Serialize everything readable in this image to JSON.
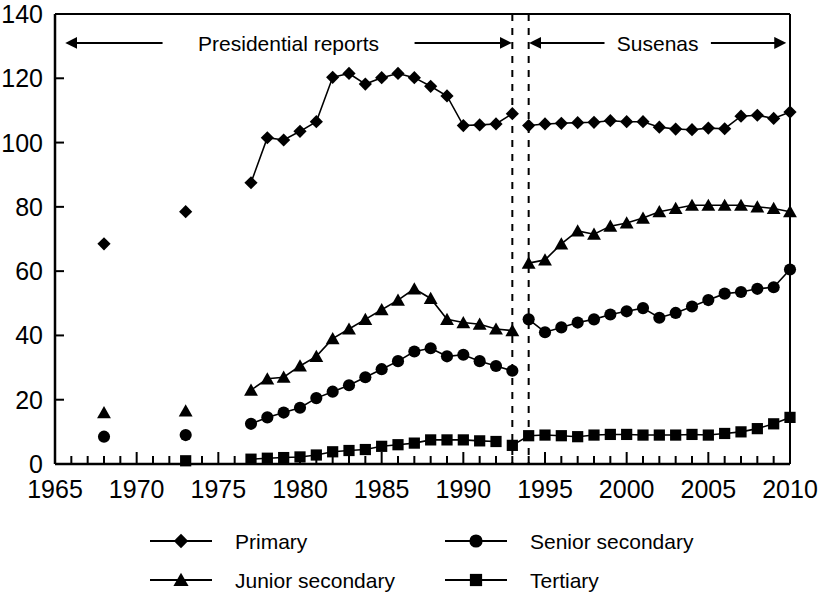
{
  "chart_data": {
    "type": "line",
    "title": "",
    "xlabel": "",
    "ylabel": "",
    "xlim": [
      1965,
      2010
    ],
    "ylim": [
      0,
      140
    ],
    "grid": false,
    "legend_position": "bottom",
    "xticks": [
      1965,
      1970,
      1975,
      1980,
      1985,
      1990,
      1995,
      2000,
      2005,
      2010
    ],
    "xtick_labels": [
      "1965",
      "1970",
      "1975",
      "1980",
      "1985",
      "1990",
      "1995",
      "2000",
      "2005",
      "2010"
    ],
    "xminor_step": 1,
    "yticks": [
      0,
      20,
      40,
      60,
      80,
      100,
      120,
      140
    ],
    "ytick_labels": [
      "0",
      "20",
      "40",
      "60",
      "80",
      "100",
      "120",
      "140"
    ],
    "annotations": [
      {
        "name": "presidential-reports-span",
        "label": "Presidential reports",
        "x_start": 1965.8,
        "x_end": 1992.8,
        "y": 131,
        "arrow": "both"
      },
      {
        "name": "susenas-span",
        "label": "Susenas",
        "x_start": 1994.2,
        "x_end": 2009.6,
        "y": 131,
        "arrow": "both"
      }
    ],
    "vlines": [
      {
        "name": "vline-1993",
        "x": 1993,
        "style": "dashed"
      },
      {
        "name": "vline-1994",
        "x": 1994,
        "style": "dashed"
      }
    ],
    "series": [
      {
        "name": "Primary",
        "marker": "diamond",
        "color": "#000000",
        "segments": [
          {
            "points": [
              [
                1968,
                68.5
              ]
            ]
          },
          {
            "points": [
              [
                1973,
                78.5
              ]
            ]
          },
          {
            "points": [
              [
                1977,
                87.5
              ],
              [
                1978,
                101.5
              ],
              [
                1979,
                100.8
              ],
              [
                1980,
                103.5
              ],
              [
                1981,
                106.5
              ],
              [
                1982,
                120.3
              ],
              [
                1983,
                121.5
              ],
              [
                1984,
                118.2
              ],
              [
                1985,
                120.2
              ],
              [
                1986,
                121.5
              ],
              [
                1987,
                120.2
              ],
              [
                1988,
                117.5
              ],
              [
                1989,
                114.5
              ],
              [
                1990,
                105.3
              ],
              [
                1991,
                105.5
              ],
              [
                1992,
                105.8
              ],
              [
                1993,
                109.0
              ]
            ]
          },
          {
            "points": [
              [
                1994,
                105.3
              ],
              [
                1995,
                105.8
              ],
              [
                1996,
                106.0
              ],
              [
                1997,
                106.2
              ],
              [
                1998,
                106.3
              ],
              [
                1999,
                106.8
              ],
              [
                2000,
                106.5
              ],
              [
                2001,
                106.5
              ],
              [
                2002,
                104.8
              ],
              [
                2003,
                104.2
              ],
              [
                2004,
                104.0
              ],
              [
                2005,
                104.5
              ],
              [
                2006,
                104.3
              ],
              [
                2007,
                108.2
              ],
              [
                2008,
                108.5
              ],
              [
                2009,
                107.5
              ],
              [
                2010,
                109.5
              ]
            ]
          }
        ]
      },
      {
        "name": "Junior secondary",
        "marker": "triangle",
        "color": "#000000",
        "segments": [
          {
            "points": [
              [
                1968,
                16.0
              ]
            ]
          },
          {
            "points": [
              [
                1973,
                16.5
              ]
            ]
          },
          {
            "points": [
              [
                1977,
                23.0
              ],
              [
                1978,
                26.5
              ],
              [
                1979,
                27.0
              ],
              [
                1980,
                30.5
              ],
              [
                1981,
                33.5
              ],
              [
                1982,
                39.0
              ],
              [
                1983,
                42.0
              ],
              [
                1984,
                45.0
              ],
              [
                1985,
                48.0
              ],
              [
                1986,
                51.0
              ],
              [
                1987,
                54.5
              ],
              [
                1988,
                51.5
              ],
              [
                1989,
                45.0
              ],
              [
                1990,
                44.0
              ],
              [
                1991,
                43.5
              ],
              [
                1992,
                42.0
              ],
              [
                1993,
                41.5
              ]
            ]
          },
          {
            "points": [
              [
                1994,
                62.5
              ],
              [
                1995,
                63.5
              ],
              [
                1996,
                68.5
              ],
              [
                1997,
                72.5
              ],
              [
                1998,
                71.5
              ],
              [
                1999,
                74.0
              ],
              [
                2000,
                75.0
              ],
              [
                2001,
                76.5
              ],
              [
                2002,
                78.5
              ],
              [
                2003,
                79.5
              ],
              [
                2004,
                80.5
              ],
              [
                2005,
                80.5
              ],
              [
                2006,
                80.5
              ],
              [
                2007,
                80.5
              ],
              [
                2008,
                80.0
              ],
              [
                2009,
                79.5
              ],
              [
                2010,
                78.5
              ]
            ]
          }
        ]
      },
      {
        "name": "Senior secondary",
        "marker": "circle",
        "color": "#000000",
        "segments": [
          {
            "points": [
              [
                1968,
                8.5
              ]
            ]
          },
          {
            "points": [
              [
                1973,
                9.0
              ]
            ]
          },
          {
            "points": [
              [
                1977,
                12.5
              ],
              [
                1978,
                14.5
              ],
              [
                1979,
                16.0
              ],
              [
                1980,
                17.5
              ],
              [
                1981,
                20.5
              ],
              [
                1982,
                22.5
              ],
              [
                1983,
                24.5
              ],
              [
                1984,
                27.0
              ],
              [
                1985,
                29.5
              ],
              [
                1986,
                32.0
              ],
              [
                1987,
                35.0
              ],
              [
                1988,
                36.0
              ],
              [
                1989,
                33.5
              ],
              [
                1990,
                34.0
              ],
              [
                1991,
                32.0
              ],
              [
                1992,
                30.5
              ],
              [
                1993,
                29.0
              ]
            ]
          },
          {
            "points": [
              [
                1994,
                45.0
              ],
              [
                1995,
                41.0
              ],
              [
                1996,
                42.5
              ],
              [
                1997,
                44.0
              ],
              [
                1998,
                45.0
              ],
              [
                1999,
                46.5
              ],
              [
                2000,
                47.5
              ],
              [
                2001,
                48.5
              ],
              [
                2002,
                45.5
              ],
              [
                2003,
                47.0
              ],
              [
                2004,
                49.0
              ],
              [
                2005,
                51.0
              ],
              [
                2006,
                53.0
              ],
              [
                2007,
                53.5
              ],
              [
                2008,
                54.5
              ],
              [
                2009,
                55.0
              ],
              [
                2010,
                60.5
              ]
            ]
          }
        ]
      },
      {
        "name": "Tertiary",
        "marker": "square",
        "color": "#000000",
        "segments": [
          {
            "points": [
              [
                1973,
                1.0
              ]
            ]
          },
          {
            "points": [
              [
                1977,
                1.5
              ],
              [
                1978,
                1.8
              ],
              [
                1979,
                2.0
              ],
              [
                1980,
                2.2
              ],
              [
                1981,
                2.8
              ],
              [
                1982,
                3.8
              ],
              [
                1983,
                4.2
              ],
              [
                1984,
                4.5
              ],
              [
                1985,
                5.5
              ],
              [
                1986,
                6.0
              ],
              [
                1987,
                6.5
              ],
              [
                1988,
                7.5
              ],
              [
                1989,
                7.5
              ],
              [
                1990,
                7.5
              ],
              [
                1991,
                7.2
              ],
              [
                1992,
                7.0
              ]
            ]
          },
          {
            "points": [
              [
                1993,
                5.8
              ],
              [
                1994,
                8.8
              ],
              [
                1995,
                9.0
              ],
              [
                1996,
                8.8
              ],
              [
                1997,
                8.5
              ],
              [
                1998,
                9.0
              ],
              [
                1999,
                9.2
              ],
              [
                2000,
                9.2
              ],
              [
                2001,
                9.0
              ],
              [
                2002,
                9.0
              ],
              [
                2003,
                9.0
              ],
              [
                2004,
                9.2
              ],
              [
                2005,
                9.0
              ],
              [
                2006,
                9.5
              ],
              [
                2007,
                10.0
              ],
              [
                2008,
                11.0
              ],
              [
                2009,
                12.5
              ],
              [
                2010,
                14.5
              ]
            ]
          }
        ]
      }
    ],
    "legend": [
      {
        "name": "Primary",
        "marker": "diamond"
      },
      {
        "name": "Senior secondary",
        "marker": "circle"
      },
      {
        "name": "Junior secondary",
        "marker": "triangle"
      },
      {
        "name": "Tertiary",
        "marker": "square"
      }
    ]
  }
}
